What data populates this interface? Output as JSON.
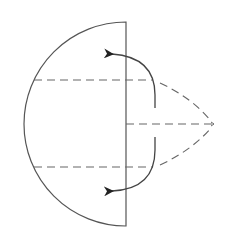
{
  "diagram": {
    "colors": {
      "stroke": "#555555",
      "dash": "#666666",
      "arrowhead": "#222222",
      "background": "#ffffff"
    },
    "elements": [
      {
        "id": "half-disk-outline",
        "type": "arc+line"
      },
      {
        "id": "upper-ray",
        "type": "dashed-line"
      },
      {
        "id": "lower-ray",
        "type": "dashed-line"
      },
      {
        "id": "axis-ray",
        "type": "dashed-line"
      },
      {
        "id": "upper-cone-edge",
        "type": "dashed-curve"
      },
      {
        "id": "lower-cone-edge",
        "type": "dashed-curve"
      },
      {
        "id": "upper-curved-arrow",
        "type": "arrow"
      },
      {
        "id": "lower-curved-arrow",
        "type": "arrow"
      }
    ]
  }
}
